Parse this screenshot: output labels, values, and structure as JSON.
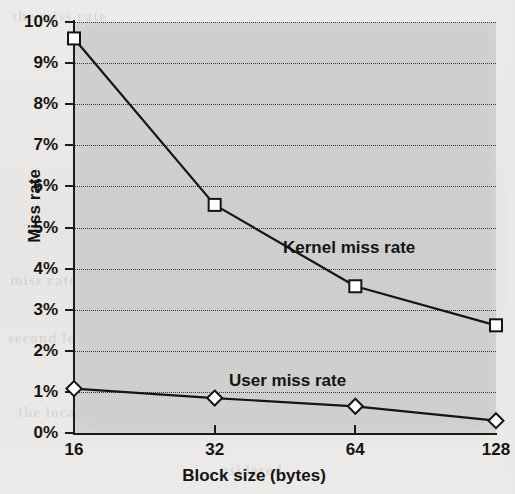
{
  "chart_data": {
    "type": "line",
    "title": "",
    "xlabel": "Block size (bytes)",
    "ylabel": "Miss rate",
    "categories": [
      "16",
      "32",
      "64",
      "128"
    ],
    "x": [
      16,
      32,
      64,
      128
    ],
    "x_scale": "log2-evenly-spaced",
    "xlim": [
      16,
      128
    ],
    "ylim": [
      0,
      10
    ],
    "y_unit": "%",
    "y_ticks": [
      "0%",
      "1%",
      "2%",
      "3%",
      "4%",
      "5%",
      "6%",
      "7%",
      "8%",
      "9%",
      "10%"
    ],
    "y_tick_values": [
      0,
      1,
      2,
      3,
      4,
      5,
      6,
      7,
      8,
      9,
      10
    ],
    "grid": "horizontal-dotted",
    "legend": "inline-annotations",
    "series": [
      {
        "name": "Kernel miss rate",
        "marker": "square",
        "values": [
          9.6,
          5.55,
          3.57,
          2.62
        ]
      },
      {
        "name": "User miss rate",
        "marker": "diamond",
        "values": [
          1.08,
          0.85,
          0.65,
          0.3
        ]
      }
    ],
    "annotations": [
      {
        "text": "Kernel miss rate",
        "series": "Kernel miss rate"
      },
      {
        "text": "User miss rate",
        "series": "User miss rate"
      }
    ],
    "colors": {
      "line": "#141414",
      "marker_fill": "#ffffff",
      "plot_background": "#cbcbc9",
      "page_background": "#eceae8",
      "grid": "#3a3a3a",
      "axis": "#1b1b1b",
      "text": "#141414"
    }
  },
  "bleed_text": [
    {
      "text": "the miss rate",
      "x": 12,
      "y": 8,
      "size": 15
    },
    {
      "text": "cache",
      "x": 196,
      "y": 196,
      "size": 15
    },
    {
      "text": "miss rate of",
      "x": 10,
      "y": 272,
      "size": 15
    },
    {
      "text": "second level",
      "x": 8,
      "y": 330,
      "size": 15
    },
    {
      "text": "the local",
      "x": 18,
      "y": 404,
      "size": 15
    },
    {
      "text": "nsidered",
      "x": 220,
      "y": 462,
      "size": 15
    }
  ]
}
